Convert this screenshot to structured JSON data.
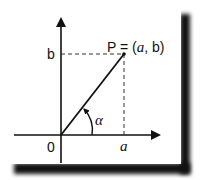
{
  "diagram": {
    "type": "polar-coordinate-illustration",
    "labels": {
      "point": "P = (a, b)",
      "point_prefix": "P = (",
      "point_a": "a",
      "point_mid": ", b)",
      "y_value": "b",
      "x_value": "a",
      "origin": "0",
      "angle": "α"
    },
    "colors": {
      "line": "#111111",
      "background": "#ffffff",
      "shadow": "#111111"
    }
  }
}
